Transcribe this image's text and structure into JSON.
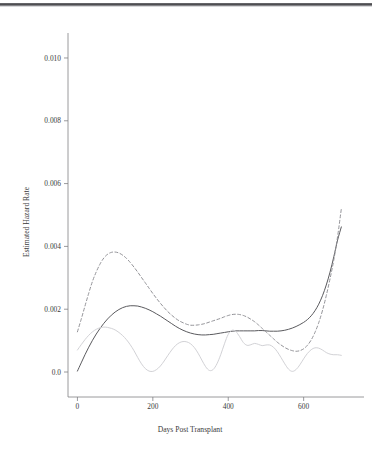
{
  "figure": {
    "name": "estimated-hazard-rate-plot",
    "background": "#ffffff"
  },
  "chart_data": {
    "type": "line",
    "title": "",
    "subtitle": "",
    "xlabel": "Days Post Transplant",
    "ylabel": "Estimated Hazard Rate",
    "xlim": [
      -25,
      715
    ],
    "ylim": [
      -0.00035,
      0.0107
    ],
    "grid": false,
    "legend": "none",
    "xticks": [
      0,
      200,
      400,
      600
    ],
    "xtick_labels": [
      "0",
      "200",
      "400",
      "600"
    ],
    "yticks": [
      0.0,
      0.002,
      0.004,
      0.006,
      0.008,
      0.01
    ],
    "ytick_labels": [
      "0.0",
      "0.002",
      "0.004",
      "0.006",
      "0.008",
      "0.010"
    ],
    "colors": {
      "solid": "#5a5a5e",
      "dashed": "#8d8d92",
      "faint": "#d2d2d6",
      "axis": "#808084"
    },
    "series": [
      {
        "name": "solid-curve",
        "style": "solid",
        "color": "#5a5a5e",
        "x": [
          0,
          10,
          20,
          30,
          40,
          50,
          60,
          70,
          80,
          90,
          100,
          110,
          120,
          130,
          140,
          150,
          160,
          170,
          180,
          190,
          200,
          210,
          220,
          230,
          240,
          250,
          260,
          270,
          280,
          290,
          300,
          310,
          320,
          330,
          340,
          350,
          360,
          370,
          380,
          390,
          400,
          410,
          420,
          430,
          440,
          450,
          460,
          470,
          480,
          490,
          500,
          510,
          520,
          530,
          540,
          550,
          560,
          570,
          580,
          590,
          600,
          610,
          620,
          630,
          640,
          650,
          660,
          670,
          680,
          690,
          700
        ],
        "y": [
          3e-05,
          0.00029,
          0.00055,
          0.00079,
          0.00101,
          0.00121,
          0.00139,
          0.00155,
          0.00169,
          0.00181,
          0.00191,
          0.00199,
          0.00205,
          0.00209,
          0.00211,
          0.00211,
          0.0021,
          0.00207,
          0.00203,
          0.00198,
          0.00192,
          0.00185,
          0.00178,
          0.0017,
          0.00162,
          0.00154,
          0.00146,
          0.00139,
          0.00133,
          0.00128,
          0.00124,
          0.00121,
          0.00119,
          0.00118,
          0.00118,
          0.00119,
          0.0012,
          0.00122,
          0.00124,
          0.00126,
          0.00128,
          0.0013,
          0.00131,
          0.00131,
          0.00131,
          0.00131,
          0.00131,
          0.00131,
          0.00132,
          0.00132,
          0.00131,
          0.0013,
          0.0013,
          0.0013,
          0.00131,
          0.00133,
          0.00136,
          0.0014,
          0.00145,
          0.00151,
          0.00158,
          0.00167,
          0.00179,
          0.00195,
          0.00216,
          0.00243,
          0.00277,
          0.00318,
          0.00367,
          0.0042,
          0.00462
        ]
      },
      {
        "name": "dashed-curve",
        "style": "dashed",
        "color": "#8d8d92",
        "x": [
          0,
          10,
          20,
          30,
          40,
          50,
          60,
          70,
          80,
          90,
          100,
          110,
          120,
          130,
          140,
          150,
          160,
          170,
          180,
          190,
          200,
          210,
          220,
          230,
          240,
          250,
          260,
          270,
          280,
          290,
          300,
          310,
          320,
          330,
          340,
          350,
          360,
          370,
          380,
          390,
          400,
          410,
          420,
          430,
          440,
          450,
          460,
          470,
          480,
          490,
          500,
          510,
          520,
          530,
          540,
          550,
          560,
          570,
          580,
          590,
          600,
          610,
          620,
          630,
          640,
          650,
          660,
          670,
          680,
          690,
          700
        ],
        "y": [
          0.00128,
          0.00168,
          0.0021,
          0.00251,
          0.00289,
          0.00319,
          0.00344,
          0.00363,
          0.00375,
          0.00381,
          0.00382,
          0.00379,
          0.00372,
          0.00362,
          0.00349,
          0.00334,
          0.00318,
          0.00301,
          0.00284,
          0.00267,
          0.0025,
          0.00234,
          0.00219,
          0.00205,
          0.00192,
          0.00181,
          0.00171,
          0.00163,
          0.00157,
          0.00152,
          0.00149,
          0.00149,
          0.0015,
          0.00152,
          0.00155,
          0.00159,
          0.00163,
          0.00167,
          0.00171,
          0.00176,
          0.0018,
          0.00183,
          0.00184,
          0.00183,
          0.0018,
          0.00175,
          0.00168,
          0.0016,
          0.0015,
          0.00139,
          0.00128,
          0.00117,
          0.00106,
          0.00095,
          0.00086,
          0.00078,
          0.00072,
          0.00068,
          0.00066,
          0.00068,
          0.00074,
          0.00085,
          0.00102,
          0.00126,
          0.00157,
          0.00196,
          0.00243,
          0.00297,
          0.00357,
          0.00431,
          0.0052
        ]
      },
      {
        "name": "faint-curve",
        "style": "solid-light",
        "color": "#d2d2d6",
        "x": [
          0,
          10,
          20,
          30,
          40,
          50,
          60,
          70,
          80,
          90,
          100,
          110,
          120,
          130,
          140,
          150,
          160,
          170,
          180,
          190,
          200,
          210,
          220,
          230,
          240,
          250,
          260,
          270,
          280,
          290,
          300,
          310,
          320,
          330,
          340,
          350,
          360,
          370,
          380,
          390,
          400,
          410,
          420,
          430,
          440,
          450,
          460,
          470,
          480,
          490,
          500,
          510,
          520,
          530,
          540,
          550,
          560,
          570,
          580,
          590,
          600,
          610,
          620,
          630,
          640,
          650,
          660,
          670,
          680,
          690,
          700
        ],
        "y": [
          0.0007,
          0.00087,
          0.00103,
          0.00117,
          0.00128,
          0.00136,
          0.00141,
          0.00143,
          0.00142,
          0.00139,
          0.00134,
          0.00126,
          0.00116,
          0.00103,
          0.00087,
          0.00068,
          0.00046,
          0.00026,
          0.00011,
          3e-05,
          2e-05,
          8e-05,
          0.00019,
          0.00035,
          0.00053,
          0.0007,
          0.00084,
          0.00093,
          0.00097,
          0.00096,
          0.0009,
          0.00078,
          0.0006,
          0.00038,
          0.00017,
          5e-05,
          8e-05,
          0.00026,
          0.00055,
          0.0009,
          0.0012,
          0.00133,
          0.00129,
          0.00113,
          0.00094,
          0.00085,
          0.00087,
          0.00091,
          0.00088,
          0.00084,
          0.00086,
          0.00086,
          0.00079,
          0.00065,
          0.00046,
          0.00026,
          9e-05,
          2e-05,
          8e-05,
          0.00023,
          0.00042,
          0.00059,
          0.00071,
          0.00077,
          0.00076,
          0.0007,
          0.00062,
          0.00057,
          0.00055,
          0.00055,
          0.00053
        ]
      }
    ]
  }
}
